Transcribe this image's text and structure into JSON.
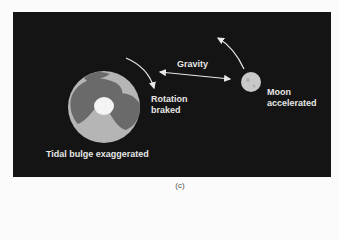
{
  "figure": {
    "caption": "(c)",
    "labels": {
      "gravity": "Gravity",
      "rotation_line1": "Rotation",
      "rotation_line2": "braked",
      "moon_line1": "Moon",
      "moon_line2": "accelerated",
      "tidal_bulge": "Tidal bulge exaggerated"
    },
    "bodies": [
      "earth",
      "moon"
    ],
    "colors": {
      "background": "#141414",
      "earth_ocean": "#b5b5b5",
      "earth_land": "#6a6a6a",
      "ice_cap": "#f4f4f4",
      "moon": "#c9c9c9",
      "text": "#e6e6e6"
    }
  }
}
